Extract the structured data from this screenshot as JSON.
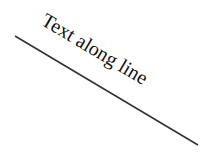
{
  "diagram": {
    "label": "Text along line",
    "line": {
      "x1": 15,
      "y1": 36,
      "x2": 198,
      "y2": 145,
      "color": "#333333"
    },
    "text_color": "#111111"
  }
}
